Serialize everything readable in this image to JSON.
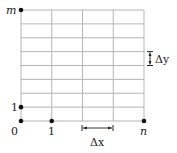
{
  "diagram": {
    "type": "grid",
    "columns": 4,
    "rows": 8,
    "colors": {
      "grid": "#b5b5b5",
      "dot": "#111111",
      "text": "#222222"
    },
    "labels": {
      "origin": "0",
      "x_one": "1",
      "x_end": "n",
      "y_one": "1",
      "y_end": "m",
      "dx": "Δx",
      "dy": "Δy"
    },
    "points": [
      {
        "name": "origin",
        "i": 0,
        "j": 0
      },
      {
        "name": "x-one",
        "i": 1,
        "j": 0
      },
      {
        "name": "x-end",
        "i": 4,
        "j": 0
      },
      {
        "name": "y-one",
        "i": 0,
        "j": 1
      },
      {
        "name": "y-end",
        "i": 0,
        "j": 8
      }
    ]
  }
}
